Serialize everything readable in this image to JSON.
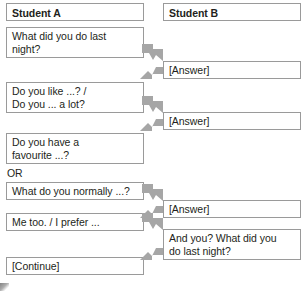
{
  "colors": {
    "box_border": "#9a9a9a",
    "text": "#231f20",
    "arrow": "#a6a6a6",
    "background": "#ffffff"
  },
  "columns": {
    "student_a": {
      "header": "Student A"
    },
    "student_b": {
      "header": "Student B"
    }
  },
  "separator_text": "OR",
  "dialogue": {
    "student_a_turns": [
      {
        "text": "What did you do last\nnight?"
      },
      {
        "text": "Do you like ...? /\nDo you ... a lot?"
      },
      {
        "text": "Do you have a\nfavourite ...?"
      },
      {
        "text": "What do you normally ...?"
      },
      {
        "text": "Me too. / I prefer ..."
      },
      {
        "text": "[Continue]"
      }
    ],
    "student_b_turns": [
      {
        "text": "[Answer]"
      },
      {
        "text": "[Answer]"
      },
      {
        "text": "[Answer]"
      },
      {
        "text": "And you? What did you\ndo last night?"
      }
    ]
  },
  "arrows": {
    "to_b_label": "arrow-to-student-b",
    "to_a_label": "arrow-to-student-a",
    "count_to_b": 4,
    "count_to_a": 4
  }
}
